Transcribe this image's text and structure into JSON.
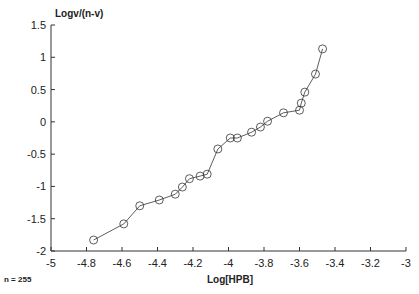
{
  "chart_data": {
    "type": "line",
    "title": "",
    "xlabel": "Log[HPB]",
    "ylabel": "Logv/(n-v)",
    "xlim": [
      -5,
      -3
    ],
    "ylim": [
      -2,
      1.5
    ],
    "xticks": [
      -5,
      -4.8,
      -4.6,
      -4.4,
      -4.2,
      -4,
      -3.8,
      -3.6,
      -3.4,
      -3.2,
      -3
    ],
    "xtick_labels": [
      "-5",
      "-4.8",
      "-4.6",
      "-4.4",
      "-4.2",
      "-4",
      "-3.8",
      "-3.6",
      "-3.4",
      "-3.2",
      "-3"
    ],
    "yticks": [
      -2,
      -1.5,
      -1,
      -0.5,
      0,
      0.5,
      1,
      1.5
    ],
    "ytick_labels": [
      "-2",
      "-1.5",
      "-1",
      "-0.5",
      "0",
      "0.5",
      "1",
      "1.5"
    ],
    "grid": false,
    "marker": "open-circle",
    "annotation": "n = 255",
    "series": [
      {
        "name": "data",
        "x": [
          -4.76,
          -4.59,
          -4.5,
          -4.39,
          -4.3,
          -4.26,
          -4.22,
          -4.16,
          -4.12,
          -4.06,
          -3.99,
          -3.95,
          -3.87,
          -3.82,
          -3.78,
          -3.69,
          -3.6,
          -3.59,
          -3.57,
          -3.51,
          -3.47
        ],
        "y": [
          -1.83,
          -1.58,
          -1.3,
          -1.21,
          -1.12,
          -1.01,
          -0.88,
          -0.84,
          -0.81,
          -0.42,
          -0.25,
          -0.25,
          -0.16,
          -0.08,
          0.01,
          0.14,
          0.18,
          0.29,
          0.46,
          0.74,
          1.13
        ]
      }
    ]
  }
}
